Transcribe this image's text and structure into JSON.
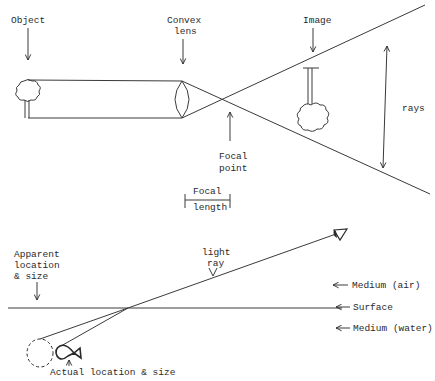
{
  "top_diagram": {
    "title": "Convex lens image formation",
    "labels": {
      "object": "Object",
      "convex_lens_line1": "Convex",
      "convex_lens_line2": "lens",
      "image": "Image",
      "rays": "rays",
      "focal_point_line1": "Focal",
      "focal_point_line2": "point",
      "focal_length_line1": "Focal",
      "focal_length_line2": "length"
    },
    "icons": [
      "tree-object-icon",
      "convex-lens-icon",
      "inverted-tree-image-icon"
    ]
  },
  "bottom_diagram": {
    "title": "Refraction at water surface",
    "labels": {
      "apparent_line1": "Apparent",
      "apparent_line2": "location",
      "apparent_line3": "& size",
      "light_ray_line1": "light",
      "light_ray_line2": "ray",
      "medium_air": "Medium (air)",
      "surface": "Surface",
      "medium_water": "Medium (water)",
      "actual": "Actual location & size"
    },
    "icons": [
      "eye-icon",
      "fish-icon",
      "apparent-fish-dashed-circle"
    ]
  },
  "colors": {
    "ink": "#2a2a2a",
    "background": "#ffffff"
  }
}
